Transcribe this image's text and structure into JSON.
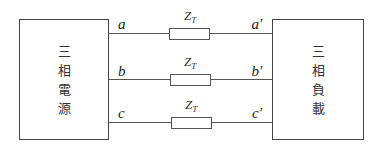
{
  "diagram": {
    "source_box": {
      "label_chars": [
        "三",
        "相",
        "電",
        "源"
      ]
    },
    "load_box": {
      "label_chars": [
        "三",
        "相",
        "負",
        "載"
      ]
    },
    "lines": [
      {
        "source_terminal": "a",
        "load_terminal": "a′",
        "impedance": "Z",
        "impedance_sub": "T"
      },
      {
        "source_terminal": "b",
        "load_terminal": "b′",
        "impedance": "Z",
        "impedance_sub": "T"
      },
      {
        "source_terminal": "c",
        "load_terminal": "c′",
        "impedance": "Z",
        "impedance_sub": "T"
      }
    ]
  }
}
